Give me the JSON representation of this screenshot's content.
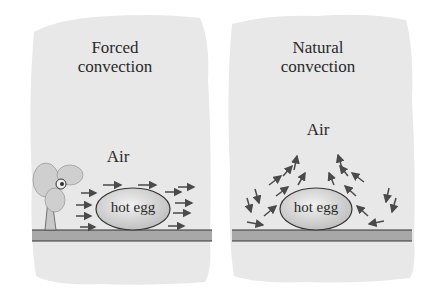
{
  "left_panel": {
    "title_line1": "Forced",
    "title_line2": "convection",
    "air_label": "Air",
    "egg_label": "hot egg",
    "fan_icon": "fan-icon",
    "flow": "horizontal-arrows"
  },
  "right_panel": {
    "title_line1": "Natural",
    "title_line2": "convection",
    "air_label": "Air",
    "egg_label": "hot egg",
    "flow": "rising-plume-arrows"
  },
  "colors": {
    "background_patch": "#e8e8e8",
    "ground": "#a8a8a8",
    "egg_fill": "#d0d0d0",
    "arrow": "#4a4a4a",
    "text": "#2a2a2a"
  }
}
